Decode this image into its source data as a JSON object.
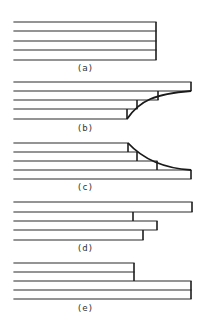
{
  "diagram": {
    "stroke_color": "#2a2a2a",
    "background": "#ffffff",
    "panels": [
      {
        "id": "a",
        "label": "(a)",
        "label_pos": [
          85,
          71
        ],
        "lines": [
          {
            "x1": 14,
            "y": 22,
            "x2": 156
          },
          {
            "x1": 14,
            "y": 31,
            "x2": 156
          },
          {
            "x1": 14,
            "y": 41,
            "x2": 156
          },
          {
            "x1": 14,
            "y": 50,
            "x2": 156
          },
          {
            "x1": 14,
            "y": 60,
            "x2": 156
          }
        ],
        "verticals": [
          {
            "x": 156,
            "y1": 22,
            "y2": 60
          }
        ],
        "curve": null
      },
      {
        "id": "b",
        "label": "(b)",
        "label_pos": [
          85,
          131
        ],
        "lines": [
          {
            "x1": 14,
            "y": 82,
            "x2": 191
          },
          {
            "x1": 14,
            "y": 91,
            "x2": 191
          },
          {
            "x1": 14,
            "y": 100,
            "x2": 158
          },
          {
            "x1": 14,
            "y": 109,
            "x2": 137
          },
          {
            "x1": 14,
            "y": 119,
            "x2": 127
          }
        ],
        "verticals": [
          {
            "x": 191,
            "y1": 82,
            "y2": 91
          },
          {
            "x": 158,
            "y1": 91,
            "y2": 100
          },
          {
            "x": 137,
            "y1": 100,
            "y2": 109
          },
          {
            "x": 127,
            "y1": 109,
            "y2": 119
          }
        ],
        "curve": "M127,119 C140,100 155,94 191,91"
      },
      {
        "id": "c",
        "label": "(c)",
        "label_pos": [
          85,
          190
        ],
        "lines": [
          {
            "x1": 14,
            "y": 143,
            "x2": 128
          },
          {
            "x1": 14,
            "y": 152,
            "x2": 137
          },
          {
            "x1": 14,
            "y": 161,
            "x2": 157
          },
          {
            "x1": 14,
            "y": 170,
            "x2": 191
          },
          {
            "x1": 14,
            "y": 179,
            "x2": 191
          }
        ],
        "verticals": [
          {
            "x": 128,
            "y1": 143,
            "y2": 152
          },
          {
            "x": 137,
            "y1": 152,
            "y2": 161
          },
          {
            "x": 157,
            "y1": 161,
            "y2": 170
          },
          {
            "x": 191,
            "y1": 170,
            "y2": 179
          }
        ],
        "curve": "M128,143 C140,156 160,168 191,170"
      },
      {
        "id": "d",
        "label": "(d)",
        "label_pos": [
          85,
          251
        ],
        "lines": [
          {
            "x1": 14,
            "y": 202,
            "x2": 192
          },
          {
            "x1": 14,
            "y": 212,
            "x2": 192
          },
          {
            "x1": 14,
            "y": 221,
            "x2": 157
          },
          {
            "x1": 14,
            "y": 230,
            "x2": 157
          },
          {
            "x1": 14,
            "y": 240,
            "x2": 143
          }
        ],
        "verticals": [
          {
            "x": 192,
            "y1": 202,
            "y2": 212
          },
          {
            "x": 133,
            "y1": 212,
            "y2": 221
          },
          {
            "x": 157,
            "y1": 221,
            "y2": 230
          },
          {
            "x": 143,
            "y1": 230,
            "y2": 240
          }
        ],
        "curve": null
      },
      {
        "id": "e",
        "label": "(e)",
        "label_pos": [
          85,
          311
        ],
        "lines": [
          {
            "x1": 14,
            "y": 263,
            "x2": 134
          },
          {
            "x1": 14,
            "y": 272,
            "x2": 134
          },
          {
            "x1": 14,
            "y": 281,
            "x2": 191
          },
          {
            "x1": 14,
            "y": 290,
            "x2": 191
          },
          {
            "x1": 14,
            "y": 299,
            "x2": 191
          }
        ],
        "verticals": [
          {
            "x": 134,
            "y1": 263,
            "y2": 281
          },
          {
            "x": 191,
            "y1": 281,
            "y2": 299
          }
        ],
        "curve": null
      }
    ]
  }
}
